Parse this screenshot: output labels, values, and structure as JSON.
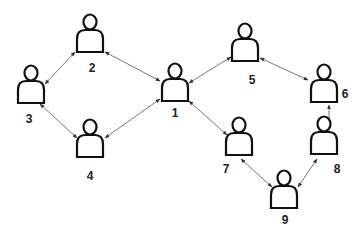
{
  "diagram": {
    "type": "network",
    "directed": "bidirectional",
    "colors": {
      "background": "#ffffff",
      "stroke": "#111111",
      "edge": "#555555",
      "label": "#222222"
    },
    "nodes": [
      {
        "id": "1",
        "label": "1",
        "icon": "person-icon",
        "x": 175,
        "y": 80,
        "lx": 175,
        "ly": 117
      },
      {
        "id": "2",
        "label": "2",
        "icon": "person-icon",
        "x": 90,
        "y": 31,
        "lx": 92,
        "ly": 72
      },
      {
        "id": "3",
        "label": "3",
        "icon": "person-icon",
        "x": 31,
        "y": 82,
        "lx": 29,
        "ly": 123
      },
      {
        "id": "4",
        "label": "4",
        "icon": "person-icon",
        "x": 90,
        "y": 136,
        "lx": 90,
        "ly": 180
      },
      {
        "id": "5",
        "label": "5",
        "icon": "person-icon",
        "x": 245,
        "y": 40,
        "lx": 252,
        "ly": 84
      },
      {
        "id": "6",
        "label": "6",
        "icon": "person-icon",
        "x": 324,
        "y": 81,
        "lx": 345,
        "ly": 98
      },
      {
        "id": "7",
        "label": "7",
        "icon": "person-icon",
        "x": 239,
        "y": 134,
        "lx": 226,
        "ly": 173
      },
      {
        "id": "8",
        "label": "8",
        "icon": "person-icon",
        "x": 324,
        "y": 133,
        "lx": 337,
        "ly": 173
      },
      {
        "id": "9",
        "label": "9",
        "icon": "person-icon",
        "x": 284,
        "y": 187,
        "lx": 285,
        "ly": 224
      }
    ],
    "edges": [
      {
        "from": "2",
        "to": "3",
        "x1": 75,
        "y1": 52,
        "x2": 45,
        "y2": 84
      },
      {
        "from": "3",
        "to": "4",
        "x1": 40,
        "y1": 104,
        "x2": 77,
        "y2": 138
      },
      {
        "from": "2",
        "to": "1",
        "x1": 105,
        "y1": 52,
        "x2": 160,
        "y2": 81
      },
      {
        "from": "1",
        "to": "4",
        "x1": 160,
        "y1": 99,
        "x2": 105,
        "y2": 138
      },
      {
        "from": "1",
        "to": "5",
        "x1": 189,
        "y1": 83,
        "x2": 231,
        "y2": 57
      },
      {
        "from": "5",
        "to": "6",
        "x1": 260,
        "y1": 58,
        "x2": 308,
        "y2": 80
      },
      {
        "from": "1",
        "to": "7",
        "x1": 189,
        "y1": 101,
        "x2": 227,
        "y2": 135
      },
      {
        "from": "6",
        "to": "8",
        "x1": 329,
        "y1": 105,
        "x2": 329,
        "y2": 124
      },
      {
        "from": "7",
        "to": "9",
        "x1": 241,
        "y1": 159,
        "x2": 272,
        "y2": 187
      },
      {
        "from": "9",
        "to": "8",
        "x1": 298,
        "y1": 187,
        "x2": 317,
        "y2": 159
      }
    ]
  }
}
